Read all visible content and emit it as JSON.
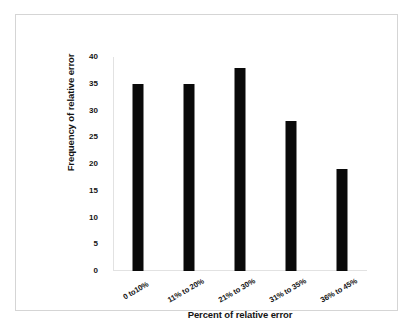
{
  "chart_data": {
    "type": "bar",
    "title": "",
    "subtitle": "",
    "categories": [
      "0 to10%",
      "11% to 20%",
      "21% to 30%",
      "31% to 35%",
      "36% to 45%"
    ],
    "values": [
      35,
      35,
      38,
      28,
      19
    ],
    "xlabel": "Percent of relative error",
    "ylabel": "Frequency of relative error",
    "ylim": [
      0,
      40
    ],
    "yticks": [
      0,
      5,
      10,
      15,
      20,
      25,
      30,
      35,
      40
    ],
    "ytick_labels": [
      "0",
      "5",
      "10",
      "15",
      "20",
      "25",
      "30",
      "35",
      "40"
    ],
    "grid": false,
    "legend": null,
    "legend_position": "none",
    "bar_color": "#0a0a0a",
    "axis_color": "#e2e2e2",
    "frame_color": "#d5d5d5",
    "background": "#ffffff",
    "text_color": "#141414"
  }
}
